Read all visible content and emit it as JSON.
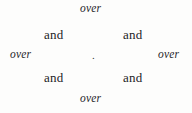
{
  "page": {
    "background_color": "#fdfdfc",
    "text_color": "#26262a",
    "width": 192,
    "height": 113
  },
  "layout": {
    "arrangement": "diamond-radial",
    "description": "Eight words arranged radially around a central dot"
  },
  "words": {
    "over_top": "over",
    "and_top_left": "and",
    "and_top_right": "and",
    "over_left": "over",
    "center_dot": ".",
    "over_right": "over",
    "and_bottom_left": "and",
    "and_bottom_right": "and",
    "over_bottom": "over"
  }
}
